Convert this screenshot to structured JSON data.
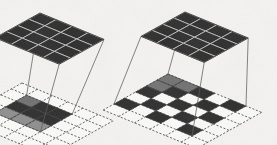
{
  "figure": {
    "title": "",
    "domain": "diagram",
    "background_color": "#f5f4f2",
    "texture": "scanned-paper-speckle"
  },
  "palette": {
    "dark_cell": "#2b2b2b",
    "darker_cell": "#1d1d1d",
    "mid_gray_cell": "#707070",
    "light_gray_cell": "#8d8d8d",
    "empty_cell": "#fbfbfa",
    "grid_line": "#333333",
    "dashed_line": "#3a3a3a",
    "projection_line": "#555555",
    "tile_separator": "#d8d7d4"
  },
  "panels": [
    {
      "id": "left-panel",
      "name": "standard-convolution",
      "label": "",
      "output_grid": {
        "name": "output-feature-map",
        "rows": 4,
        "cols": 4,
        "style": "solid-dark",
        "fill": "#2b2b2b",
        "origin": {
          "x": 40,
          "y": 13
        },
        "u": {
          "x": 16.0,
          "y": 6.6
        },
        "v": {
          "x": -11.2,
          "y": 6.2
        }
      },
      "input_grid": {
        "name": "input-feature-map",
        "rows": 6,
        "cols": 6,
        "style": "dashed",
        "origin": {
          "x": 22,
          "y": 83
        },
        "u": {
          "x": 15.2,
          "y": 6.3
        },
        "v": {
          "x": -10.6,
          "y": 5.9
        },
        "highlighted_cells": [
          {
            "r": 1,
            "c": 1,
            "shade": "mid"
          },
          {
            "r": 1,
            "c": 2,
            "shade": "dark"
          },
          {
            "r": 1,
            "c": 3,
            "shade": "dark"
          },
          {
            "r": 2,
            "c": 1,
            "shade": "dark"
          },
          {
            "r": 2,
            "c": 2,
            "shade": "dark"
          },
          {
            "r": 2,
            "c": 3,
            "shade": "dark"
          },
          {
            "r": 3,
            "c": 1,
            "shade": "light"
          },
          {
            "r": 3,
            "c": 2,
            "shade": "light"
          },
          {
            "r": 3,
            "c": 3,
            "shade": "light"
          }
        ],
        "receptive_field": {
          "rows": 3,
          "cols": 3,
          "dilation": 1
        }
      },
      "projection_lines": 4
    },
    {
      "id": "right-panel",
      "name": "dilated-convolution",
      "label": "",
      "output_grid": {
        "name": "output-feature-map",
        "rows": 4,
        "cols": 4,
        "style": "solid-dark",
        "fill": "#2b2b2b",
        "origin": {
          "x": 185,
          "y": 12
        },
        "u": {
          "x": 15.8,
          "y": 6.5
        },
        "v": {
          "x": -11.0,
          "y": 6.1
        }
      },
      "input_grid": {
        "name": "input-feature-map",
        "rows": 6,
        "cols": 6,
        "style": "dashed",
        "origin": {
          "x": 168,
          "y": 74
        },
        "u": {
          "x": 15.6,
          "y": 6.4
        },
        "v": {
          "x": -10.8,
          "y": 6.0
        },
        "highlighted_cells": [
          {
            "r": 0,
            "c": 0,
            "shade": "mid"
          },
          {
            "r": 0,
            "c": 1,
            "shade": "mid"
          },
          {
            "r": 0,
            "c": 2,
            "shade": "dark"
          },
          {
            "r": 0,
            "c": 4,
            "shade": "dark"
          },
          {
            "r": 1,
            "c": 0,
            "shade": "mid"
          },
          {
            "r": 1,
            "c": 1,
            "shade": "dark"
          },
          {
            "r": 1,
            "c": 3,
            "shade": "dark"
          },
          {
            "r": 2,
            "c": 0,
            "shade": "dark"
          },
          {
            "r": 2,
            "c": 2,
            "shade": "dark"
          },
          {
            "r": 2,
            "c": 4,
            "shade": "dark"
          },
          {
            "r": 3,
            "c": 1,
            "shade": "dark"
          },
          {
            "r": 3,
            "c": 3,
            "shade": "dark"
          },
          {
            "r": 4,
            "c": 0,
            "shade": "dark"
          },
          {
            "r": 4,
            "c": 2,
            "shade": "dark"
          },
          {
            "r": 4,
            "c": 4,
            "shade": "dark"
          }
        ],
        "receptive_field": {
          "rows": 3,
          "cols": 3,
          "dilation": 2
        }
      },
      "projection_lines": 4
    }
  ]
}
